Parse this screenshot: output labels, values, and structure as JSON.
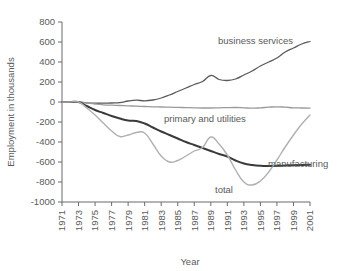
{
  "chart_data": {
    "type": "line",
    "title": "",
    "xlabel": "Year",
    "ylabel": "Employment in thousands",
    "xlim": [
      1971,
      2001
    ],
    "ylim": [
      -1000,
      800
    ],
    "ytick_values": [
      800,
      600,
      400,
      200,
      0,
      -200,
      -400,
      -600,
      -800,
      -1000
    ],
    "ytick_labels": [
      "800",
      "600",
      "400",
      "200",
      "0",
      "-200",
      "-400",
      "-600",
      "-800",
      "-1000"
    ],
    "xtick_values": [
      1971,
      1973,
      1975,
      1977,
      1979,
      1981,
      1983,
      1985,
      1987,
      1989,
      1991,
      1993,
      1995,
      1997,
      1999,
      2001
    ],
    "xtick_labels": [
      "1971",
      "1973",
      "1975",
      "1977",
      "1979",
      "1981",
      "1983",
      "1985",
      "1987",
      "1989",
      "1991",
      "1993",
      "1995",
      "1997",
      "1999",
      "2001"
    ],
    "grid": false,
    "legend_position": "inline-annotations",
    "x": [
      1971,
      1972,
      1973,
      1974,
      1975,
      1976,
      1977,
      1978,
      1979,
      1980,
      1981,
      1982,
      1983,
      1984,
      1985,
      1986,
      1987,
      1988,
      1989,
      1990,
      1991,
      1992,
      1993,
      1994,
      1995,
      1996,
      1997,
      1998,
      1999,
      2000,
      2001
    ],
    "series": [
      {
        "name": "business services",
        "label": "business services",
        "color": "#5a5a5a",
        "width": 1.3,
        "values": [
          0,
          0,
          0,
          -8,
          -12,
          -12,
          -10,
          -6,
          10,
          18,
          12,
          20,
          40,
          70,
          105,
          140,
          175,
          205,
          265,
          225,
          215,
          230,
          270,
          310,
          360,
          400,
          440,
          500,
          540,
          580,
          605
        ]
      },
      {
        "name": "primary and utilities",
        "label": "primary and utilities",
        "color": "#9a9a9a",
        "width": 1.3,
        "values": [
          0,
          0,
          0,
          -10,
          -20,
          -28,
          -32,
          -35,
          -38,
          -42,
          -45,
          -48,
          -50,
          -52,
          -54,
          -56,
          -58,
          -60,
          -60,
          -58,
          -56,
          -55,
          -58,
          -62,
          -58,
          -52,
          -48,
          -52,
          -58,
          -60,
          -62
        ]
      },
      {
        "name": "manufacturing",
        "label": "manufacturing",
        "color": "#3a3a3a",
        "width": 2.0,
        "values": [
          0,
          0,
          0,
          -40,
          -80,
          -110,
          -140,
          -165,
          -185,
          -190,
          -215,
          -255,
          -295,
          -330,
          -365,
          -400,
          -430,
          -460,
          -490,
          -520,
          -545,
          -585,
          -615,
          -630,
          -638,
          -640,
          -638,
          -635,
          -632,
          -630,
          -628
        ]
      },
      {
        "name": "total",
        "label": "total",
        "color": "#b0b0b0",
        "width": 1.4,
        "values": [
          0,
          0,
          0,
          -60,
          -130,
          -210,
          -290,
          -345,
          -330,
          -305,
          -310,
          -420,
          -540,
          -600,
          -585,
          -540,
          -490,
          -455,
          -350,
          -420,
          -530,
          -680,
          -800,
          -830,
          -790,
          -700,
          -580,
          -450,
          -330,
          -220,
          -130
        ]
      }
    ],
    "annotations": [
      {
        "text": "business services",
        "series": "business services",
        "x_px": 218,
        "y_px": 44
      },
      {
        "text": "primary and utilities",
        "series": "primary and utilities",
        "x_px": 164,
        "y_px": 122
      },
      {
        "text": "manufacturing",
        "series": "manufacturing",
        "x_px": 268,
        "y_px": 167
      },
      {
        "text": "total",
        "series": "total",
        "x_px": 215,
        "y_px": 193
      }
    ]
  }
}
